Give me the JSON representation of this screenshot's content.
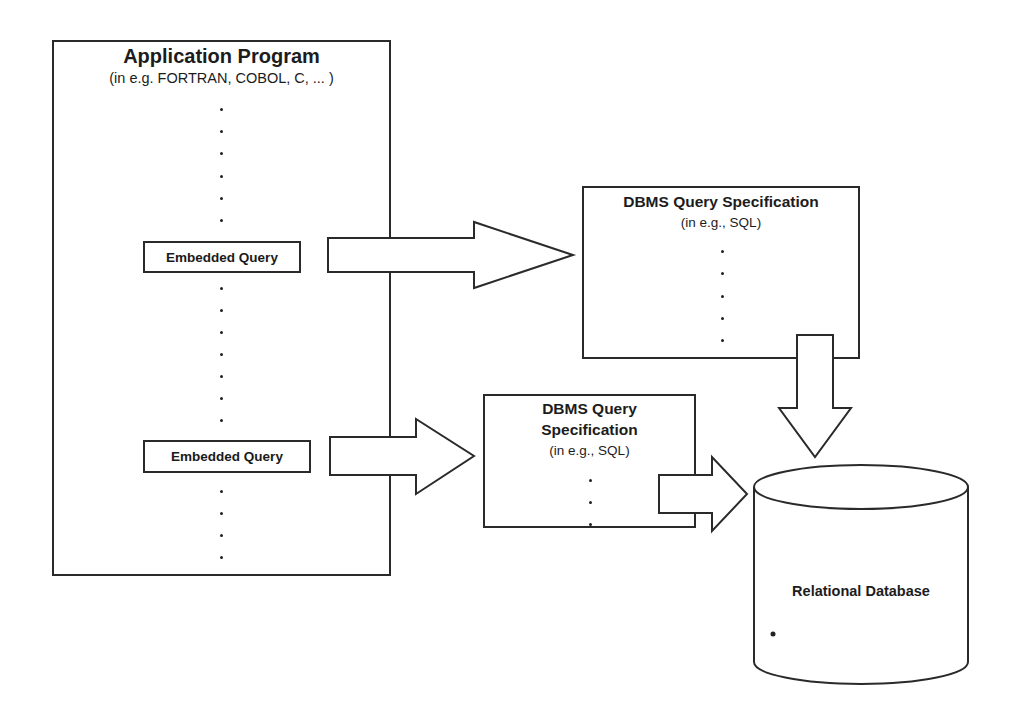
{
  "diagram": {
    "application_program": {
      "title": "Application Program",
      "subtitle": "(in e.g. FORTRAN, COBOL, C, ... )"
    },
    "embedded_queries": [
      {
        "label": "Embedded Query"
      },
      {
        "label": "Embedded Query"
      }
    ],
    "dbms_spec_1": {
      "title": "DBMS Query Specification",
      "subtitle": "(in e.g., SQL)"
    },
    "dbms_spec_2": {
      "title_line1": "DBMS Query",
      "title_line2": "Specification",
      "subtitle": "(in e.g., SQL)"
    },
    "database": {
      "label": "Relational Database"
    },
    "arrows": [
      {
        "from": "embedded-query-1",
        "to": "dbms-spec-1",
        "direction": "right"
      },
      {
        "from": "embedded-query-2",
        "to": "dbms-spec-2",
        "direction": "right"
      },
      {
        "from": "dbms-spec-1",
        "to": "relational-database",
        "direction": "down"
      },
      {
        "from": "dbms-spec-2",
        "to": "relational-database",
        "direction": "right"
      }
    ],
    "colors": {
      "stroke": "#2a2a2a",
      "fill": "#ffffff",
      "text": "#1c1c1c"
    }
  }
}
